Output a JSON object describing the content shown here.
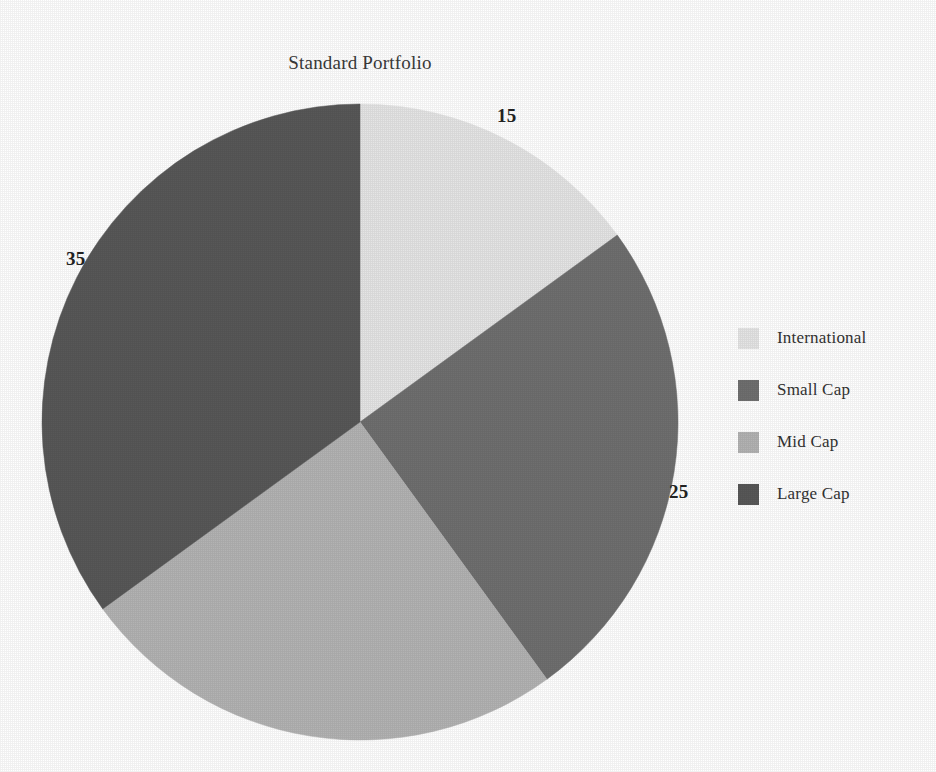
{
  "chart_data": {
    "type": "pie",
    "title": "Standard Portfolio",
    "categories": [
      "International",
      "Small Cap",
      "Mid Cap",
      "Large Cap"
    ],
    "values": [
      15,
      25,
      25,
      35
    ],
    "value_labels": [
      "15",
      "25",
      "",
      "35"
    ],
    "colors": [
      "#e5e5e5",
      "#6f6f6f",
      "#b3b3b3",
      "#585858"
    ],
    "legend_position": "right",
    "grid": false,
    "start_angle_deg": 0,
    "direction": "clockwise",
    "xlabel": "",
    "ylabel": ""
  },
  "title": {
    "text": "Standard Portfolio"
  },
  "labels": {
    "international": "15",
    "small_cap": "25",
    "large_cap": "35"
  },
  "legend": {
    "items": [
      {
        "label": "International",
        "color": "#e5e5e5"
      },
      {
        "label": "Small Cap",
        "color": "#6f6f6f"
      },
      {
        "label": "Mid Cap",
        "color": "#b3b3b3"
      },
      {
        "label": "Large Cap",
        "color": "#585858"
      }
    ]
  }
}
